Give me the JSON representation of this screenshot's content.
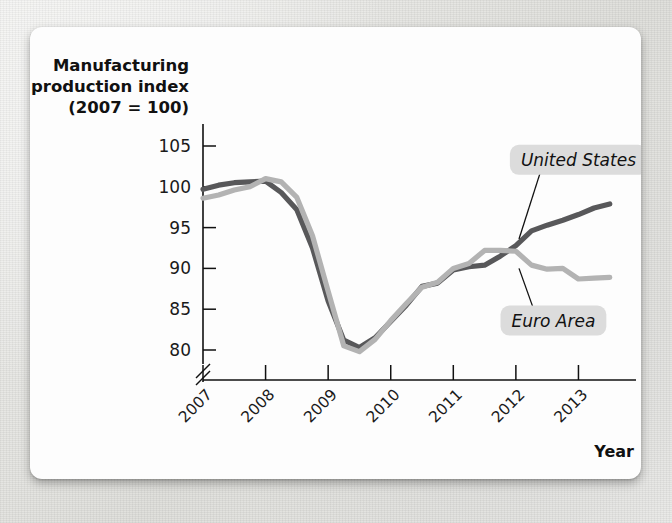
{
  "figure": {
    "background_color": "#e9e9e7",
    "card_color": "#fdfdfd"
  },
  "chart_data": {
    "type": "line",
    "title": "",
    "ylabel_lines": [
      "Manufacturing",
      "production index",
      "(2007 = 100)"
    ],
    "xlabel": "Year",
    "xtick_labels": [
      "2007",
      "2008",
      "2009",
      "2010",
      "2011",
      "2012",
      "2013"
    ],
    "ytick_labels": [
      "105",
      "100",
      "95",
      "90",
      "85",
      "80"
    ],
    "ytick_values": [
      105,
      100,
      95,
      90,
      85,
      80
    ],
    "ylim": [
      78.5,
      106.5
    ],
    "xlim": [
      2007,
      2013.6
    ],
    "axis_break": true,
    "grid": false,
    "legend_position": "inline-callouts",
    "series": [
      {
        "name": "United States",
        "color": "#58585a",
        "x": [
          2007.0,
          2007.25,
          2007.5,
          2007.75,
          2008.0,
          2008.25,
          2008.5,
          2008.75,
          2009.0,
          2009.25,
          2009.5,
          2009.75,
          2010.0,
          2010.25,
          2010.5,
          2010.75,
          2011.0,
          2011.25,
          2011.5,
          2011.75,
          2012.0,
          2012.25,
          2012.5,
          2012.75,
          2013.0,
          2013.25,
          2013.5
        ],
        "values": [
          99.7,
          100.2,
          100.5,
          100.6,
          100.7,
          99.3,
          97.2,
          92.5,
          86.0,
          81.2,
          80.3,
          81.5,
          83.5,
          85.5,
          87.8,
          88.2,
          89.8,
          90.2,
          90.4,
          91.5,
          92.8,
          94.6,
          95.3,
          95.9,
          96.6,
          97.4,
          97.9
        ]
      },
      {
        "name": "Euro Area",
        "color": "#b3b3b3",
        "x": [
          2007.0,
          2007.25,
          2007.5,
          2007.75,
          2008.0,
          2008.25,
          2008.5,
          2008.75,
          2009.0,
          2009.25,
          2009.5,
          2009.75,
          2010.0,
          2010.25,
          2010.5,
          2010.75,
          2011.0,
          2011.25,
          2011.5,
          2011.75,
          2012.0,
          2012.25,
          2012.5,
          2012.75,
          2013.0,
          2013.25,
          2013.5
        ],
        "values": [
          98.6,
          99.0,
          99.6,
          100.0,
          101.0,
          100.6,
          98.7,
          94.0,
          87.2,
          80.5,
          79.8,
          81.3,
          83.6,
          85.7,
          87.7,
          88.3,
          90.0,
          90.6,
          92.2,
          92.2,
          92.1,
          90.4,
          89.9,
          90.0,
          88.7,
          88.8,
          88.9
        ]
      }
    ],
    "annotations": [
      {
        "name": "united-states-callout",
        "text": "United States",
        "x": 2013.0,
        "y": 103.3
      },
      {
        "name": "euro-area-callout",
        "text": "Euro Area",
        "x": 2012.6,
        "y": 83.6
      }
    ]
  }
}
